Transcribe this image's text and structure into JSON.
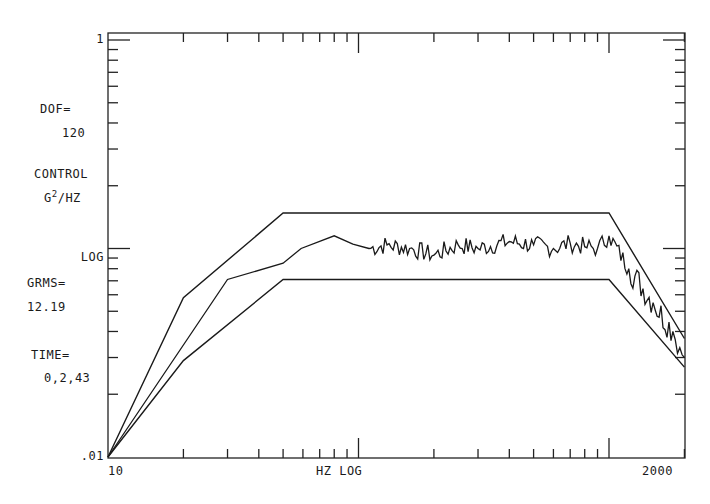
{
  "chart_data": {
    "type": "line",
    "title": "",
    "xlabel": "HZ  LOG",
    "ylabel": "CONTROL G2/HZ LOG",
    "x_scale": "log",
    "y_scale": "log",
    "xlim": [
      10,
      2000
    ],
    "ylim": [
      0.01,
      1
    ],
    "x_tick_labels": [
      "10",
      "2000"
    ],
    "y_tick_labels": [
      "1",
      ".01"
    ],
    "grid": false,
    "legend": null,
    "annotations": {
      "dof_label": "DOF=",
      "dof_value": "120",
      "control_label": "CONTROL",
      "units_base": "G",
      "units_exp": "2",
      "units_rest": "/HZ",
      "log_label": "LOG",
      "grms_label": "GRMS=",
      "grms_value": "12.19",
      "time_label": "TIME=",
      "time_value": "0,2,43"
    },
    "series": [
      {
        "name": "Upper tolerance",
        "x": [
          10,
          20,
          50,
          1000,
          2000
        ],
        "values": [
          0.01,
          0.058,
          0.148,
          0.148,
          0.037
        ]
      },
      {
        "name": "Lower tolerance",
        "x": [
          10,
          20,
          50,
          1000,
          2000
        ],
        "values": [
          0.01,
          0.029,
          0.071,
          0.071,
          0.027
        ]
      },
      {
        "name": "Control",
        "x": [
          10,
          30,
          50,
          59,
          80,
          95,
          110,
          130,
          160,
          200,
          250,
          300,
          400,
          500,
          600,
          700,
          800,
          900,
          1000,
          1200,
          1500,
          1800,
          2000
        ],
        "values": [
          0.01,
          0.071,
          0.085,
          0.1,
          0.115,
          0.105,
          0.1,
          0.104,
          0.1,
          0.093,
          0.104,
          0.1,
          0.108,
          0.104,
          0.1,
          0.106,
          0.102,
          0.1,
          0.115,
          0.08,
          0.055,
          0.04,
          0.03
        ]
      }
    ]
  },
  "labels": {
    "y_top": "1",
    "y_bottom": ".01",
    "x_left": "10",
    "x_right": "2000",
    "x_axis": "HZ  LOG"
  }
}
